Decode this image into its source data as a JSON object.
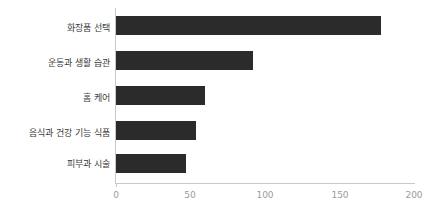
{
  "chart_data": {
    "type": "bar",
    "orientation": "horizontal",
    "title": "",
    "subtitle": "",
    "xlabel": "",
    "ylabel": "",
    "categories": [
      "화장품 선택",
      "운동과 생활 습관",
      "홈 케어",
      "음식과 건강 기능 식품",
      "피부과 시술"
    ],
    "values": [
      178,
      92,
      60,
      54,
      47
    ],
    "series": [
      {
        "name": "",
        "values": [
          178,
          92,
          60,
          54,
          47
        ]
      }
    ],
    "xlim": [
      0,
      200
    ],
    "xticks": [
      0,
      50,
      100,
      150,
      200
    ],
    "xtick_labels": [
      "0",
      "50",
      "100",
      "150",
      "200"
    ],
    "grid": false,
    "legend": false,
    "legend_position": "none",
    "annotations": [],
    "colors": {
      "bar": "#2b2b2b",
      "axis": "#c9c9c9",
      "tick_label": "#9a9a9a",
      "category_label": "#3a3a3a",
      "background": "#ffffff"
    }
  }
}
